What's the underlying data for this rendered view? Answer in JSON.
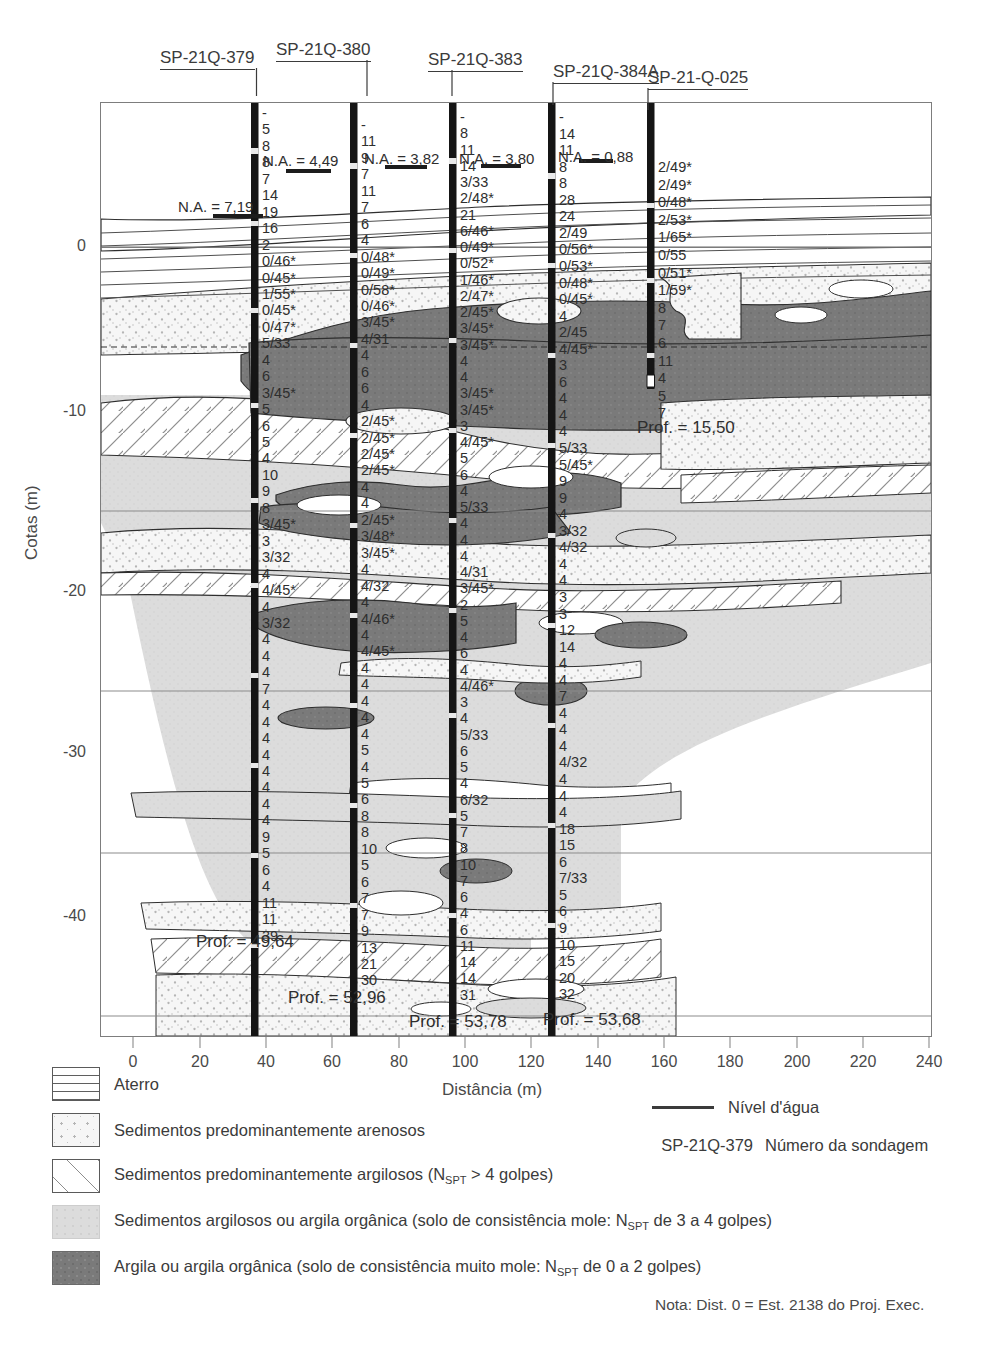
{
  "figure": {
    "y_axis_title": "Cotas (m)",
    "x_axis_title": "Distância (m)",
    "y_ticks": [
      "0",
      "-10",
      "-20",
      "-30",
      "-40"
    ],
    "y_tick_values": [
      0,
      -10,
      -20,
      -30,
      -40
    ],
    "x_ticks": [
      "0",
      "20",
      "40",
      "60",
      "80",
      "100",
      "120",
      "140",
      "160",
      "180",
      "200",
      "220",
      "240"
    ],
    "x_tick_values": [
      0,
      20,
      40,
      60,
      80,
      100,
      120,
      140,
      160,
      180,
      200,
      220,
      240
    ],
    "x_range": [
      -10,
      240
    ],
    "y_range": [
      -46,
      8
    ]
  },
  "boreholes": [
    {
      "label": "SP-21Q-379",
      "distance_m": 30,
      "water_level_label": "N.A. = 4,49",
      "secondary_water_level_label": "N.A. = 7,19",
      "depth_label": "Prof. = 49,64",
      "spt": [
        "-",
        "5",
        "8",
        "8",
        "7",
        "14",
        "19",
        "16",
        "2",
        "0/46*",
        "0/45*",
        "1/55*",
        "0/45*",
        "0/47*",
        "5/33",
        "4",
        "6",
        "3/45*",
        "5",
        "6",
        "5",
        "4",
        "10",
        "9",
        "8",
        "3/45*",
        "3",
        "3/32",
        "4",
        "4/45*",
        "4",
        "3/32",
        "4",
        "4",
        "4",
        "7",
        "4",
        "4",
        "4",
        "4",
        "4",
        "4",
        "4",
        "4",
        "9",
        "5",
        "6",
        "4",
        "11",
        "11",
        "39"
      ]
    },
    {
      "label": "SP-21Q-380",
      "distance_m": 60,
      "water_level_label": "N.A. = 3,82",
      "depth_label": "Prof. = 52,96",
      "spt": [
        "-",
        "11",
        "9",
        "7",
        "11",
        "7",
        "6",
        "4",
        "0/48*",
        "0/49*",
        "0/58*",
        "0/46*",
        "3/45*",
        "4/31",
        "4",
        "6",
        "6",
        "4",
        "2/45*",
        "2/45*",
        "2/45*",
        "2/45*",
        "4",
        "4",
        "2/45*",
        "3/48*",
        "3/45*",
        "4",
        "4/32",
        "4",
        "4/46*",
        "4",
        "4/45*",
        "4",
        "4",
        "4",
        "4",
        "4",
        "5",
        "4",
        "5",
        "6",
        "8",
        "8",
        "10",
        "5",
        "6",
        "7",
        "7",
        "9",
        "13",
        "21",
        "30"
      ]
    },
    {
      "label": "SP-21Q-383",
      "distance_m": 90,
      "water_level_label": "N.A. = 3,80",
      "depth_label": "Prof. = 53,78",
      "spt": [
        "-",
        "8",
        "11",
        "14",
        "3/33",
        "2/48*",
        "21",
        "6/46*",
        "0/49*",
        "0/52*",
        "1/46*",
        "2/47*",
        "2/45*",
        "3/45*",
        "3/45*",
        "4",
        "4",
        "3/45*",
        "3/45*",
        "3",
        "4/45*",
        "5",
        "6",
        "4",
        "5/33",
        "4",
        "4",
        "4",
        "4/31",
        "3/45*",
        "2",
        "5",
        "4",
        "6",
        "4",
        "4/46*",
        "3",
        "4",
        "5/33",
        "6",
        "5",
        "4",
        "6/32",
        "5",
        "7",
        "8",
        "10",
        "7",
        "6",
        "4",
        "6",
        "11",
        "14",
        "14",
        "31"
      ]
    },
    {
      "label": "SP-21Q-384A",
      "distance_m": 120,
      "water_level_label": "N.A. = 0,88",
      "depth_label": "Prof. = 53,68",
      "spt": [
        "-",
        "14",
        "11",
        "8",
        "8",
        "28",
        "24",
        "2/49",
        "0/56*",
        "0/53*",
        "0/48*",
        "0/45*",
        "4",
        "2/45",
        "4/45*",
        "3",
        "6",
        "4",
        "4",
        "4",
        "5/33",
        "5/45*",
        "9",
        "9",
        "4",
        "3/32",
        "4/32",
        "4",
        "4",
        "3",
        "3",
        "12",
        "14",
        "4",
        "4",
        "7",
        "4",
        "4",
        "4",
        "4/32",
        "4",
        "4",
        "4",
        "18",
        "15",
        "6",
        "7/33",
        "5",
        "6",
        "9",
        "10",
        "15",
        "20",
        "32"
      ]
    },
    {
      "label": "SP-21-Q-025",
      "distance_m": 150,
      "depth_label": "Prof. = 15,50",
      "spt": [
        "2/49*",
        "2/49*",
        "0/48*",
        "2/53*",
        "1/65*",
        "0/55",
        "0/51*",
        "1/59*",
        "8",
        "7",
        "6",
        "11",
        "4",
        "5",
        "7"
      ]
    }
  ],
  "legend": {
    "items": [
      {
        "pattern": "aterro-horizontal-lines",
        "label": "Aterro"
      },
      {
        "pattern": "areia-dots",
        "label": "Sedimentos predominantemente arenosos"
      },
      {
        "pattern": "argila-hatch",
        "label": "Sedimentos predominantemente argilosos (N_SPT > 4 golpes)",
        "label_parts": [
          "Sedimentos predominantemente argilosos (N",
          "SPT",
          " > 4 golpes)"
        ]
      },
      {
        "pattern": "argila-mole-light",
        "label": "Sedimentos argilosos ou argila orgânica (solo de consistência mole: N_SPT de 3 a 4 golpes)",
        "label_parts": [
          "Sedimentos argilosos ou argila orgânica (solo de consistência mole: N",
          "SPT",
          " de 3 a 4 golpes)"
        ]
      },
      {
        "pattern": "argila-muito-mole-dark",
        "label": "Argila ou argila orgânica (solo de consistência muito mole: N_SPT de 0 a 2 golpes)",
        "label_parts": [
          "Argila ou argila orgânica (solo de consistência muito mole: N",
          "SPT",
          " de 0 a 2 golpes)"
        ]
      }
    ],
    "water_level_symbol_label": "Nível d'água",
    "borehole_symbol_code": "SP-21Q-379",
    "borehole_symbol_label": "Número da sondagem"
  },
  "note": "Nota: Dist. 0 = Est. 2138 do Proj. Exec.",
  "colors": {
    "dark_clay": "#767676",
    "light_clay": "#d9d9d9",
    "sand_fill": "#f4f4f4",
    "sand_dot": "#b9b9b9",
    "line": "#2e2e2e",
    "frame": "#7d7d7d",
    "text": "#3b3b3b",
    "gridline": "#9a9a9a"
  },
  "chart_data": {
    "type": "table",
    "xlabel": "Distância (m)",
    "ylabel": "Cotas (m)",
    "xlim": [
      -10,
      240
    ],
    "ylim": [
      -46,
      8
    ],
    "grid": true,
    "legend_position": "below-plot",
    "series": [
      {
        "name": "SP-21Q-379",
        "x": 30,
        "ground_elev_m": 5.8,
        "final_depth_m": 49.64,
        "water_table_depth_m": 4.49,
        "sample_count": 51
      },
      {
        "name": "SP-21Q-380",
        "x": 60,
        "ground_elev_m": 6.1,
        "final_depth_m": 52.96,
        "water_table_depth_m": 3.82,
        "sample_count": 53
      },
      {
        "name": "SP-21Q-383",
        "x": 90,
        "ground_elev_m": 6.2,
        "final_depth_m": 53.78,
        "water_table_depth_m": 3.8,
        "sample_count": 55
      },
      {
        "name": "SP-21Q-384A",
        "x": 120,
        "ground_elev_m": 6.0,
        "final_depth_m": 53.68,
        "water_table_depth_m": 0.88,
        "sample_count": 54
      },
      {
        "name": "SP-21-Q-025",
        "x": 150,
        "ground_elev_m": 4.0,
        "final_depth_m": 15.5,
        "sample_count": 15
      }
    ]
  }
}
